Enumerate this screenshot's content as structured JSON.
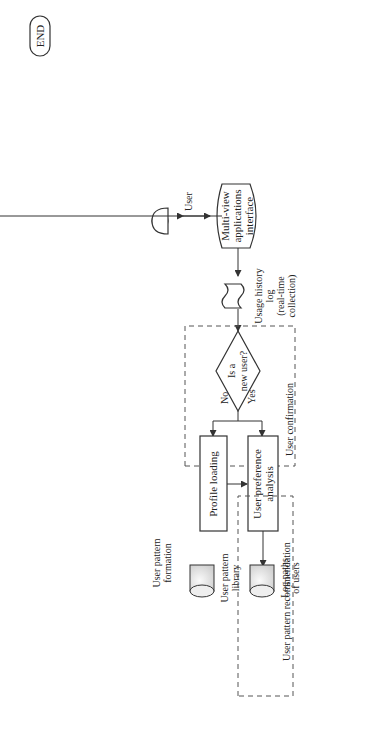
{
  "diagram": {
    "orientation": "rotated-90-ccw",
    "nodes": {
      "user": "User",
      "interface": [
        "Multi-view",
        "applications",
        "interface"
      ],
      "usage_log": [
        "Usage history",
        "log",
        "(real-time",
        "collection)"
      ],
      "new_user_decision": [
        "Is a",
        "new user?"
      ],
      "no_label_1": "No",
      "yes_label_1": "Yes",
      "profile_loading": "Profile loading",
      "user_preference": [
        "User preference",
        "analysis"
      ],
      "user_confirmation": "User confirmation",
      "user_pattern_library": [
        "User pattern",
        "library"
      ],
      "log_paths": [
        "Log paths",
        "of users"
      ],
      "user_pattern_formation": [
        "User pattern",
        "formation"
      ],
      "pattern_mapping": "Pattern mapping",
      "pattern_projection": "Pattern projection",
      "user_pattern_recommendation": "User pattern recommendation",
      "domain_ontology": "Domain ontology",
      "personal_ontology": "Personal ontology",
      "pattern_small": "Pattern",
      "user_requirement_1": "User requirement_1",
      "user_requirement_2": "User requirement_2",
      "user_profiles": [
        "User",
        "profiles"
      ],
      "profile_building": [
        "User profile",
        "building and updating"
      ],
      "threshold_decision": [
        "Does",
        "the support satisfy",
        "the threshold?"
      ],
      "yes_label_2": "Yes",
      "no_label_2": "No",
      "end": "END"
    }
  }
}
